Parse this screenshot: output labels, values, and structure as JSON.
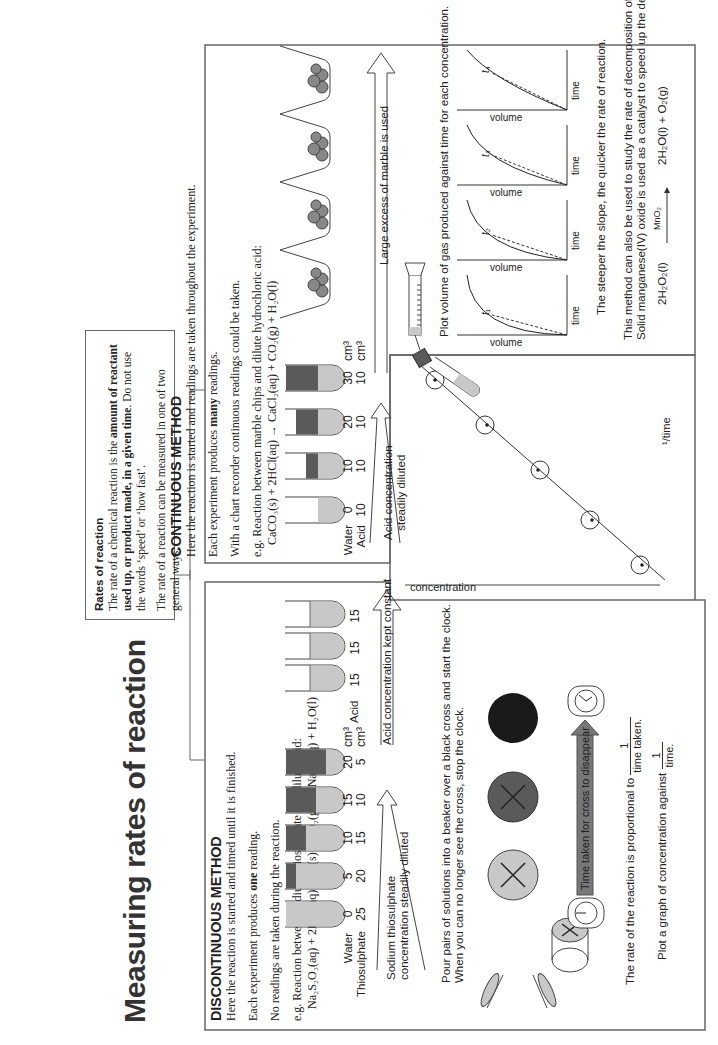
{
  "title": "Measuring rates of reaction",
  "intro": {
    "heading": "Rates of reaction",
    "p1_plain": "The rate of a chemical reaction is the ",
    "p1_bold": "amount of reactant used up, or product made, in a given time",
    "p1_end": ".  Do not use the words ‘speed’ or ‘how fast’.",
    "p2": "The rate of a reaction can be measured in one of two general ways."
  },
  "discontinuous": {
    "heading": "DISCONTINUOUS METHOD",
    "line1": "Here the reaction is started and timed until it is finished.",
    "line2_a": "Each experiment produces ",
    "line2_bold": "one",
    "line2_b": " reading.",
    "line3": "No readings are taken during the reaction.",
    "eg": "e.g. Reaction between sodium thiosulphate and dilute acid:",
    "equation": "Na₂S₂O₃(aq) + 2HCl(aq) → S(s) + SO₂(g) + 2NaCl(aq) + H₂O(l)",
    "tubes_left": {
      "row1_label": "Water",
      "row2_label": "Thiosulphate",
      "water": [
        "0",
        "5",
        "10",
        "15",
        "20"
      ],
      "thiosulphate": [
        "25",
        "20",
        "15",
        "10",
        "5"
      ],
      "unit": "cm³"
    },
    "tubes_right": {
      "label": "Acid",
      "acid": [
        "15",
        "15",
        "15",
        "15",
        "15"
      ],
      "unit": "cm³"
    },
    "arrow_left_label_1": "Sodium thiosulphate",
    "arrow_left_label_2": "concentration steadily diluted",
    "arrow_right_label": "Acid concentration kept constant",
    "instructions_1": "Pour pairs of solutions into a beaker over a black cross and start the clock.",
    "instructions_2": "When you can no longer see the cross, stop the clock.",
    "time_arrow_label": "Time taken for cross to disappear",
    "rate_text": "The rate of the reaction is proportional to",
    "rate_frac_num": "1",
    "rate_frac_den": "time taken.",
    "plot_text": "Plot a graph of concentration against",
    "plot_frac_num": "1",
    "plot_frac_den": "time.",
    "graph_ylabel": "concentration",
    "graph_xlabel": "¹/time"
  },
  "continuous": {
    "heading": "CONTINUOUS METHOD",
    "line1": "Here the reaction is started and readings are taken throughout the experiment.",
    "line2_a": "Each experiment produces ",
    "line2_bold": "many",
    "line2_b": " readings.",
    "line3": "With a chart recorder continuous readings could be taken.",
    "eg": "e.g. Reaction between marble chips and dilute hydrochloric acid:",
    "equation": "CaCO₃(s) + 2HCl(aq) → CaCl₂(aq) + CO₂(g) + H₂O(l)",
    "tubes": {
      "row1_label": "Water",
      "row2_label": "Acid",
      "water": [
        "0",
        "10",
        "20",
        "30"
      ],
      "acid": [
        "10",
        "10",
        "10",
        "10"
      ],
      "unit": "cm³"
    },
    "arrow_left_label_1": "Acid concentration",
    "arrow_left_label_2": "steadily diluted",
    "arrow_right_label": "Large excess of marble is used",
    "plot_instruction": "Plot volume of gas produced against time for each concentration.",
    "graphs": [
      {
        "tangent": "t₁",
        "ylabel": "volume",
        "xlabel": "time"
      },
      {
        "tangent": "t₂",
        "ylabel": "volume",
        "xlabel": "time"
      },
      {
        "tangent": "t₃",
        "ylabel": "volume",
        "xlabel": "time"
      },
      {
        "tangent": "t₄",
        "ylabel": "volume",
        "xlabel": "time"
      }
    ],
    "slope_text": "The steeper the slope, the quicker the rate of reaction.",
    "h2o2_line1": "This method can also be used to study the rate of decomposition of hydrogen peroxide.",
    "h2o2_line2": "Solid manganese(IV) oxide is used as a catalyst to speed up the decomposition.",
    "h2o2_lhs": "2H₂O₂(l)",
    "h2o2_catalyst": "MnO₂",
    "h2o2_rhs": "2H₂O(l) + O₂(g)"
  },
  "colors": {
    "light_fill": "#c8c8c8",
    "dark_fill": "#5a5a5a",
    "black_fill": "#1a1a1a",
    "border": "#666666"
  }
}
